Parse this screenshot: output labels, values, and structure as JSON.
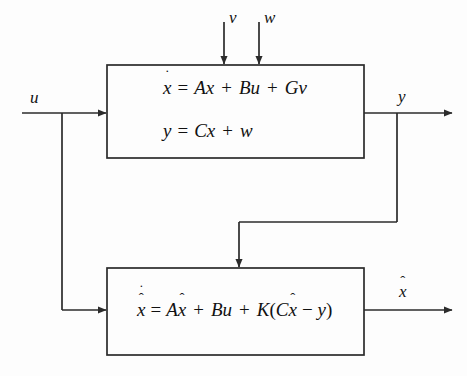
{
  "diagram": {
    "background_color": "#fdfdfd",
    "line_color": "#2b2b2b",
    "text_color": "#111111"
  },
  "blocks": [
    {
      "id": "plant",
      "name": "plant-block",
      "equations": [
        {
          "id": "plant-state-eq",
          "text": "ẋ = Ax + Bu + Gv"
        },
        {
          "id": "plant-output-eq",
          "text": "y = Cx + w"
        }
      ]
    },
    {
      "id": "observer",
      "name": "observer-block",
      "equations": [
        {
          "id": "observer-eq",
          "text": "x̂̇ = Ax̂ + Bu + K(Cx̂ − y)"
        }
      ]
    }
  ],
  "signals": {
    "input_u": "u",
    "disturbance_v": "v",
    "noise_w": "w",
    "output_y": "y",
    "estimate_xhat": "x̂"
  },
  "equation_tokens": {
    "plant_state": {
      "lhs_base": "x",
      "lhs_dot": "˙",
      "equals": "=",
      "term_a": "Ax",
      "plus_1": "+",
      "term_b": "Bu",
      "plus_2": "+",
      "term_c": "Gv"
    },
    "plant_output": {
      "lhs": "y",
      "equals": "=",
      "term_a": "Cx",
      "plus": "+",
      "term_b": "w"
    },
    "observer": {
      "lhs_base": "x",
      "lhs_hat": "ˆ",
      "lhs_dot": "˙",
      "equals": "=",
      "term_a_coef": "A",
      "term_a_base": "x",
      "term_a_hat": "ˆ",
      "plus_1": "+",
      "term_b": "Bu",
      "plus_2": "+",
      "gain": "K",
      "open_paren": "(",
      "term_c_coef": "C",
      "term_c_base": "x",
      "term_c_hat": "ˆ",
      "minus": "−",
      "term_d": "y",
      "close_paren": ")"
    },
    "estimate_out": {
      "base": "x",
      "hat": "ˆ"
    }
  }
}
